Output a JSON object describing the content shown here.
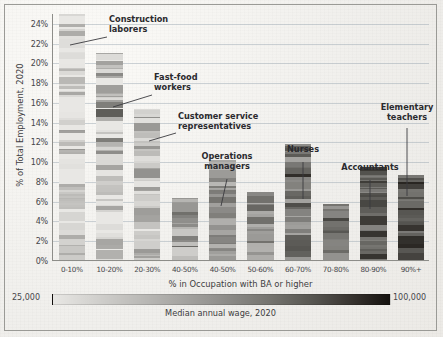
{
  "chart_data": {
    "type": "bar",
    "stacked": true,
    "title": "",
    "xlabel": "% in Occupation with BA or higher",
    "ylabel": "% of Total Employment, 2020",
    "categories": [
      "0-10%",
      "10-20%",
      "20-30%",
      "40-50%",
      "40-50%",
      "50-60%",
      "60-70%",
      "70-80%",
      "80-90%",
      "90%+"
    ],
    "values": [
      25.0,
      21.0,
      15.3,
      6.3,
      10.1,
      6.9,
      11.8,
      5.7,
      9.4,
      8.6
    ],
    "ylim": [
      0,
      25
    ],
    "yticks": [
      "0%",
      "2%",
      "4%",
      "6%",
      "8%",
      "10%",
      "12%",
      "14%",
      "16%",
      "18%",
      "20%",
      "22%",
      "24%"
    ],
    "ytick_values": [
      0,
      2,
      4,
      6,
      8,
      10,
      12,
      14,
      16,
      18,
      20,
      22,
      24
    ],
    "grid": true,
    "legend_position": "bottom",
    "colorbar": {
      "min_label": "25,000",
      "max_label": "100,000",
      "caption": "Median annual wage, 2020",
      "min_color": "#e8e7e4",
      "max_color": "#14110e"
    },
    "note": "Each bar is a stack of many thin occupation segments shaded by median annual wage."
  },
  "annotations": [
    {
      "label": "Construction\nlaborers",
      "align": "left"
    },
    {
      "label": "Fast-food\nworkers",
      "align": "left"
    },
    {
      "label": "Customer service\nrepresentatives",
      "align": "left"
    },
    {
      "label": "Operations\nmanagers",
      "align": "center"
    },
    {
      "label": "Nurses",
      "align": "center"
    },
    {
      "label": "Accountants",
      "align": "center"
    },
    {
      "label": "Elementary\nteachers",
      "align": "center"
    }
  ],
  "axes": {
    "xlabel": "% in Occupation with BA or higher",
    "ylabel": "% of Total Employment, 2020"
  },
  "legend": {
    "min": "25,000",
    "max": "100,000",
    "caption": "Median annual wage, 2020"
  }
}
